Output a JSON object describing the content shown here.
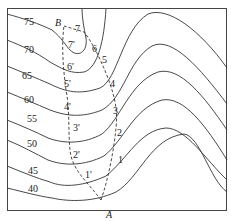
{
  "diagram": {
    "type": "contour-map",
    "contour_labels": [
      "75",
      "70",
      "65",
      "60",
      "55",
      "50",
      "45",
      "40"
    ],
    "points": {
      "start": "A",
      "end": "B"
    },
    "path_right_labels": [
      "1",
      "2",
      "3",
      "4",
      "5",
      "6",
      "7"
    ],
    "path_left_labels": [
      "1'",
      "2'",
      "3'",
      "4'",
      "5'",
      "6'",
      "7'"
    ]
  }
}
